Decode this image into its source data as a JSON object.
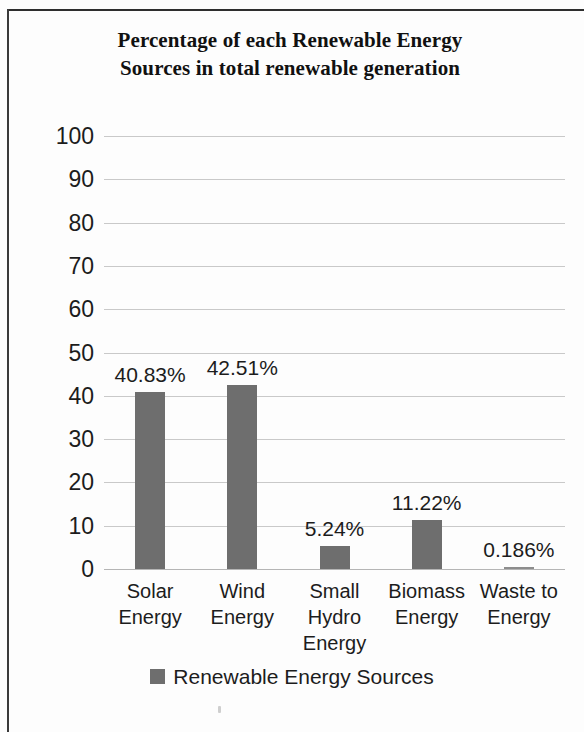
{
  "chart_data": {
    "type": "bar",
    "title": "Percentage of each Renewable Energy Sources in total renewable generation",
    "title_line1": "Percentage of each Renewable Energy",
    "title_line2": "Sources in total renewable generation",
    "categories": [
      "Solar Energy",
      "Wind Energy",
      "Small Hydro Energy",
      "Biomass Energy",
      "Waste to Energy"
    ],
    "category_lines": [
      [
        "Solar",
        "Energy"
      ],
      [
        "Wind",
        "Energy"
      ],
      [
        "Small",
        "Hydro",
        "Energy"
      ],
      [
        "Biomass",
        "Energy"
      ],
      [
        "Waste to",
        "Energy"
      ]
    ],
    "values": [
      40.83,
      42.51,
      5.24,
      11.22,
      0.186
    ],
    "data_labels": [
      "40.83%",
      "42.51%",
      "5.24%",
      "11.22%",
      "0.186%"
    ],
    "series": [
      {
        "name": "Renewable Energy Sources",
        "values": [
          40.83,
          42.51,
          5.24,
          11.22,
          0.186
        ]
      }
    ],
    "xlabel": "",
    "ylabel": "",
    "ylim": [
      0,
      100
    ],
    "ytick_labels": [
      "100",
      "90",
      "80",
      "70",
      "60",
      "50",
      "40",
      "30",
      "20",
      "10",
      "0"
    ],
    "ytick_values": [
      100,
      90,
      80,
      70,
      60,
      50,
      40,
      30,
      20,
      10,
      0
    ],
    "grid": true,
    "grid_axis": "y",
    "legend": {
      "position": "bottom",
      "entries": [
        {
          "label": "Renewable Energy Sources",
          "color": "#6e6e6e"
        }
      ]
    },
    "bar_color": "#6e6e6e",
    "background_color": "#ffffff",
    "gridline_color": "#c9c9c9"
  },
  "legend": {
    "swatch_name": "legend-color-swatch",
    "label": "Renewable Energy Sources"
  }
}
